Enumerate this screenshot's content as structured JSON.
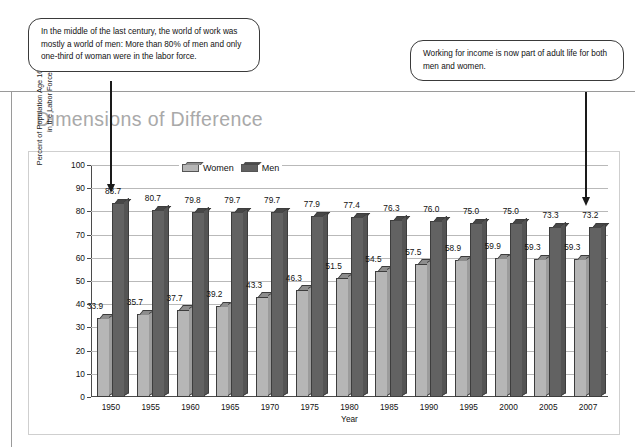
{
  "page": {
    "title": "Dimensions of Difference"
  },
  "callouts": [
    {
      "name": "callout-left",
      "text": "In the middle of the last century, the world of work was mostly a world of men: More than 80% of men and only one-third of woman were in the labor force."
    },
    {
      "name": "callout-right",
      "text": "Working for income is now part of adult life for both men and women."
    }
  ],
  "chart_data": {
    "type": "bar",
    "title": "Dimensions of Difference",
    "xlabel": "Year",
    "ylabel": "Percent of Population Age 16 and over\nin the Labor Force",
    "ylim": [
      0,
      100
    ],
    "yticks": [
      0,
      10,
      20,
      30,
      40,
      50,
      60,
      70,
      80,
      90,
      100
    ],
    "grid": true,
    "legend_position": "top-left-inside",
    "categories": [
      "1950",
      "1955",
      "1960",
      "1965",
      "1970",
      "1975",
      "1980",
      "1985",
      "1990",
      "1995",
      "2000",
      "2005",
      "2007"
    ],
    "series": [
      {
        "name": "Women",
        "color": "#b6b6b6",
        "values": [
          33.9,
          35.7,
          37.7,
          39.2,
          43.3,
          46.3,
          51.5,
          54.5,
          57.5,
          58.9,
          59.9,
          59.3,
          59.3
        ]
      },
      {
        "name": "Men",
        "color": "#626262",
        "values": [
          83.7,
          80.7,
          79.8,
          79.7,
          79.7,
          77.9,
          77.4,
          76.3,
          76.0,
          75.0,
          75.0,
          73.3,
          73.2
        ]
      }
    ]
  }
}
